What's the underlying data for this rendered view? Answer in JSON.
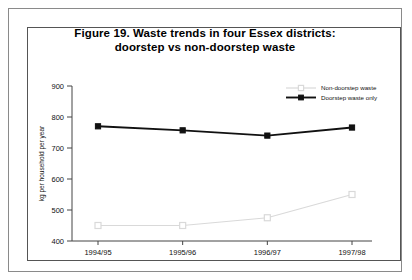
{
  "figure": {
    "title_line1": "Figure 19. Waste trends in four Essex districts:",
    "title_line2": "doorstep vs non-doorstep waste"
  },
  "chart_data": {
    "type": "line",
    "title": "Figure 19. Waste trends in four Essex districts: doorstep vs non-doorstep waste",
    "xlabel": "",
    "ylabel": "kg per household per year",
    "categories": [
      "1994/95",
      "1995/96",
      "1996/97",
      "1997/98"
    ],
    "ylim": [
      400,
      900
    ],
    "yticks": [
      400,
      500,
      600,
      700,
      800,
      900
    ],
    "ytick_labels": [
      "400",
      "500",
      "600",
      "700",
      "800",
      "900"
    ],
    "grid": false,
    "legend_position": "top-right",
    "series": [
      {
        "name": "Non-doorstep waste",
        "values": [
          450,
          450,
          475,
          550
        ],
        "color": "#d9d9d9",
        "marker": "open-square"
      },
      {
        "name": "Doorstep waste only",
        "values": [
          770,
          757,
          740,
          766
        ],
        "color": "#111111",
        "marker": "filled-square"
      }
    ]
  }
}
